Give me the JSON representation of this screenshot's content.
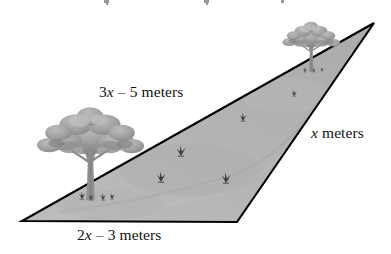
{
  "figure": {
    "type": "geometry-diagram",
    "background_color": "#ffffff",
    "field_fill_color": "#b6b6b6",
    "field_fill_color_dark": "#a8a8a8",
    "outline_color": "#000000",
    "tree_color": "#9a9a9a",
    "tree_shadow_color": "#6f6f6f",
    "shrub_color": "#3a3a3a",
    "triangle": {
      "vertices": [
        {
          "name": "left-vertex",
          "x": 22,
          "y": 221
        },
        {
          "name": "bottom-right-vertex",
          "x": 237,
          "y": 222
        },
        {
          "name": "apex-right-vertex",
          "x": 374,
          "y": 23
        }
      ]
    },
    "labels": {
      "top_side": {
        "full_text": "3x – 5 meters",
        "coefficient": "3",
        "variable": "x",
        "operator": "–",
        "constant": "5",
        "unit": "meters"
      },
      "bottom_side": {
        "full_text": "2x – 3 meters",
        "coefficient": "2",
        "variable": "x",
        "operator": "–",
        "constant": "3",
        "unit": "meters"
      },
      "right_side": {
        "full_text": "x meters",
        "variable": "x",
        "unit": "meters"
      }
    },
    "trees": [
      {
        "name": "left-tree",
        "cx": 90,
        "canopy_cy": 140,
        "scale": 1.0
      },
      {
        "name": "right-tree",
        "cx": 311,
        "canopy_cy": 38,
        "scale": 0.52
      }
    ],
    "shrubs": [
      {
        "x": 181,
        "y": 156
      },
      {
        "x": 161,
        "y": 180
      },
      {
        "x": 225,
        "y": 182
      },
      {
        "x": 243,
        "y": 120
      },
      {
        "x": 294,
        "y": 95
      },
      {
        "x": 122,
        "y": 196
      },
      {
        "x": 100,
        "y": 200
      }
    ]
  }
}
